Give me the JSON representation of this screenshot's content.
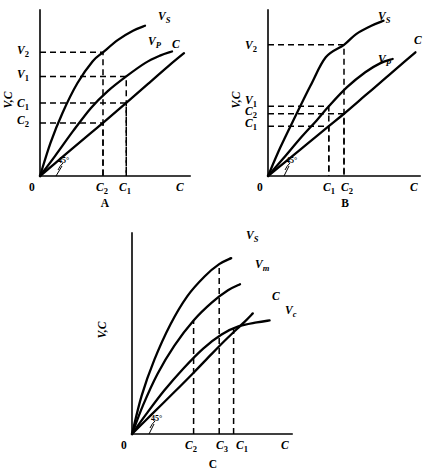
{
  "figure": {
    "background": "#ffffff",
    "ink": "#000000",
    "panel_count": 3
  },
  "chart_data": [
    {
      "type": "line",
      "panel": "A",
      "panel_label": "A",
      "title": "",
      "xlabel": "C",
      "ylabel": "V,C",
      "origin_label": "0",
      "angle_annotation": "45°",
      "grid": false,
      "legend": "inline-curve-labels",
      "xlim": [
        0,
        1
      ],
      "ylim": [
        0,
        1
      ],
      "xticks": [
        {
          "label": "C",
          "sub": "2",
          "value": 0.42
        },
        {
          "label": "C",
          "sub": "1",
          "value": 0.575
        }
      ],
      "yticks": [
        {
          "label": "V",
          "sub": "2",
          "value": 0.745
        },
        {
          "label": "V",
          "sub": "1",
          "value": 0.6
        },
        {
          "label": "C",
          "sub": "1",
          "value": 0.42
        },
        {
          "label": "C",
          "sub": "2",
          "value": 0.32
        }
      ],
      "series": [
        {
          "name": "V_S",
          "label": "V",
          "sub": "S",
          "shape": "concave-steep",
          "points": [
            [
              0,
              0
            ],
            [
              0.07,
              0.2
            ],
            [
              0.15,
              0.38
            ],
            [
              0.25,
              0.56
            ],
            [
              0.35,
              0.69
            ],
            [
              0.42,
              0.745
            ],
            [
              0.52,
              0.82
            ],
            [
              0.62,
              0.875
            ],
            [
              0.7,
              0.905
            ]
          ]
        },
        {
          "name": "V_P",
          "label": "V",
          "sub": "P",
          "shape": "concave-medium",
          "points": [
            [
              0,
              0
            ],
            [
              0.1,
              0.12
            ],
            [
              0.22,
              0.27
            ],
            [
              0.34,
              0.41
            ],
            [
              0.45,
              0.51
            ],
            [
              0.575,
              0.6
            ],
            [
              0.7,
              0.68
            ],
            [
              0.8,
              0.725
            ],
            [
              0.88,
              0.75
            ]
          ]
        },
        {
          "name": "C",
          "label": "C",
          "sub": "",
          "shape": "near-linear-45deg",
          "points": [
            [
              0,
              0
            ],
            [
              0.15,
              0.115
            ],
            [
              0.32,
              0.245
            ],
            [
              0.42,
              0.32
            ],
            [
              0.575,
              0.44
            ],
            [
              0.72,
              0.555
            ],
            [
              0.86,
              0.665
            ],
            [
              0.96,
              0.74
            ]
          ]
        }
      ],
      "dashed_guides": [
        {
          "from": "y",
          "tick": "V2",
          "to_curve": "V_S",
          "x": 0.42
        },
        {
          "from": "y",
          "tick": "V1",
          "to_curve": "V_P",
          "x": 0.575
        },
        {
          "from": "y",
          "tick": "C1",
          "to_curve": "C",
          "x": 0.575
        },
        {
          "from": "y",
          "tick": "C2",
          "to_curve": "C",
          "x": 0.42
        }
      ]
    },
    {
      "type": "line",
      "panel": "B",
      "panel_label": "B",
      "title": "",
      "xlabel": "C",
      "ylabel": "V,C",
      "origin_label": "0",
      "angle_annotation": "45°",
      "grid": false,
      "legend": "inline-curve-labels",
      "xlim": [
        0,
        1
      ],
      "ylim": [
        0,
        1
      ],
      "xticks": [
        {
          "label": "C",
          "sub": "1",
          "value": 0.4
        },
        {
          "label": "C",
          "sub": "2",
          "value": 0.5
        }
      ],
      "yticks": [
        {
          "label": "V",
          "sub": "2",
          "value": 0.79
        },
        {
          "label": "V",
          "sub": "1",
          "value": 0.42
        },
        {
          "label": "C",
          "sub": "2",
          "value": 0.375
        },
        {
          "label": "C",
          "sub": "1",
          "value": 0.3
        }
      ],
      "series": [
        {
          "name": "V_S",
          "label": "V",
          "sub": "S",
          "shape": "steep-slightly-concave",
          "points": [
            [
              0,
              0
            ],
            [
              0.08,
              0.17
            ],
            [
              0.18,
              0.36
            ],
            [
              0.28,
              0.545
            ],
            [
              0.38,
              0.715
            ],
            [
              0.5,
              0.79
            ],
            [
              0.58,
              0.855
            ],
            [
              0.68,
              0.905
            ],
            [
              0.76,
              0.935
            ]
          ]
        },
        {
          "name": "V_P",
          "label": "V",
          "sub": "P",
          "shape": "medium-slightly-concave",
          "points": [
            [
              0,
              0
            ],
            [
              0.1,
              0.105
            ],
            [
              0.22,
              0.235
            ],
            [
              0.32,
              0.335
            ],
            [
              0.4,
              0.42
            ],
            [
              0.52,
              0.535
            ],
            [
              0.64,
              0.625
            ],
            [
              0.74,
              0.68
            ],
            [
              0.82,
              0.705
            ]
          ]
        },
        {
          "name": "C",
          "label": "C",
          "sub": "",
          "shape": "near-linear-45deg",
          "points": [
            [
              0,
              0
            ],
            [
              0.12,
              0.09
            ],
            [
              0.26,
              0.195
            ],
            [
              0.4,
              0.3
            ],
            [
              0.5,
              0.375
            ],
            [
              0.64,
              0.485
            ],
            [
              0.78,
              0.595
            ],
            [
              0.9,
              0.69
            ],
            [
              0.97,
              0.745
            ]
          ]
        }
      ],
      "dashed_guides": [
        {
          "from": "y",
          "tick": "V2",
          "to_curve": "V_S",
          "x": 0.5
        },
        {
          "from": "y",
          "tick": "V1",
          "to_curve": "V_P",
          "x": 0.4
        },
        {
          "from": "y",
          "tick": "C2",
          "to_curve": "C",
          "x": 0.5
        },
        {
          "from": "y",
          "tick": "C1",
          "to_curve": "C",
          "x": 0.4
        }
      ]
    },
    {
      "type": "line",
      "panel": "C",
      "panel_label": "C",
      "title": "",
      "xlabel": "C",
      "ylabel": "V,C",
      "origin_label": "0",
      "angle_annotation": "45°",
      "grid": false,
      "legend": "inline-curve-labels",
      "xlim": [
        0,
        1
      ],
      "ylim": [
        0,
        1
      ],
      "xticks": [
        {
          "label": "C",
          "sub": "2",
          "value": 0.385
        },
        {
          "label": "C",
          "sub": "3",
          "value": 0.545
        },
        {
          "label": "C",
          "sub": "1",
          "value": 0.635
        }
      ],
      "yticks": [],
      "series": [
        {
          "name": "V_S",
          "label": "V",
          "sub": "S",
          "shape": "concave-steep",
          "points": [
            [
              0,
              0
            ],
            [
              0.06,
              0.19
            ],
            [
              0.14,
              0.37
            ],
            [
              0.24,
              0.545
            ],
            [
              0.345,
              0.685
            ],
            [
              0.455,
              0.785
            ],
            [
              0.545,
              0.845
            ],
            [
              0.62,
              0.875
            ]
          ]
        },
        {
          "name": "V_m",
          "label": "V",
          "sub": "m",
          "shape": "concave-medium",
          "points": [
            [
              0,
              0
            ],
            [
              0.07,
              0.145
            ],
            [
              0.16,
              0.3
            ],
            [
              0.265,
              0.44
            ],
            [
              0.385,
              0.565
            ],
            [
              0.5,
              0.655
            ],
            [
              0.6,
              0.715
            ],
            [
              0.675,
              0.745
            ]
          ]
        },
        {
          "name": "C",
          "label": "C",
          "sub": "",
          "shape": "near-linear-45deg",
          "points": [
            [
              0,
              0
            ],
            [
              0.12,
              0.095
            ],
            [
              0.26,
              0.205
            ],
            [
              0.385,
              0.305
            ],
            [
              0.5,
              0.4
            ],
            [
              0.6,
              0.48
            ],
            [
              0.7,
              0.555
            ],
            [
              0.755,
              0.6
            ]
          ]
        },
        {
          "name": "V_c",
          "label": "V",
          "sub": "c",
          "shape": "concave-shallow",
          "points": [
            [
              0,
              0
            ],
            [
              0.09,
              0.1
            ],
            [
              0.2,
              0.215
            ],
            [
              0.32,
              0.325
            ],
            [
              0.445,
              0.425
            ],
            [
              0.56,
              0.495
            ],
            [
              0.665,
              0.535
            ],
            [
              0.78,
              0.555
            ],
            [
              0.86,
              0.565
            ]
          ]
        }
      ],
      "dashed_guides": [
        {
          "from": "x",
          "tick": "C2",
          "to_curve": "V_m",
          "x": 0.385
        },
        {
          "from": "x",
          "tick": "C3",
          "to_curve": "V_S",
          "x": 0.545
        },
        {
          "from": "x",
          "tick": "C1",
          "to_curve": "V_c",
          "x": 0.635
        }
      ]
    }
  ]
}
